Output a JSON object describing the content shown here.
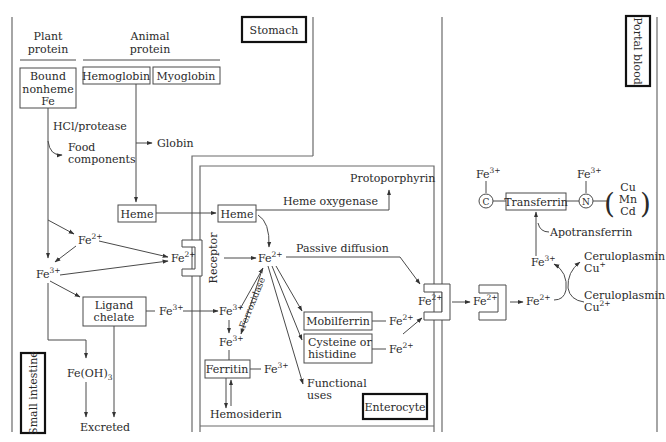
{
  "regions": {
    "stomach": "Stomach",
    "portal_blood": "Portal blood",
    "small_intestine": "Small intestine",
    "enterocyte": "Enterocyte"
  },
  "headers": {
    "plant_protein_l1": "Plant",
    "plant_protein_l2": "protein",
    "animal_protein_l1": "Animal",
    "animal_protein_l2": "protein"
  },
  "boxes": {
    "bound_nonheme_l1": "Bound",
    "bound_nonheme_l2": "nonheme",
    "bound_nonheme_l3": "Fe",
    "hemoglobin": "Hemoglobin",
    "myoglobin": "Myoglobin",
    "heme_lumen": "Heme",
    "heme_cell": "Heme",
    "ligand_l1": "Ligand",
    "ligand_l2": "chelate",
    "ferritin": "Ferritin",
    "mobilferrin": "Mobilferrin",
    "cysteine_l1": "Cysteine or",
    "cysteine_l2": "histidine",
    "transferrin": "Transferrin"
  },
  "labels": {
    "hcl_protease": "HCl/protease",
    "food_l1": "Food",
    "food_l2": "components",
    "globin": "Globin",
    "protoporphyrin": "Protoporphyrin",
    "heme_oxygenase": "Heme oxygenase",
    "passive_diffusion": "Passive diffusion",
    "receptor": "Receptor",
    "ferroxidase": "Ferroxidase",
    "functional_l1": "Functional",
    "functional_l2": "uses",
    "hemosiderin": "Hemosiderin",
    "fe_oh3": "Fe(OH)",
    "fe_oh3_sub": "3",
    "excreted": "Excreted",
    "apotransferrin": "Apotransferrin",
    "ceruloplasmin_a": "Ceruloplasmin",
    "cu_plus": "Cu",
    "cu_plus_sup": "+",
    "ceruloplasmin_b": "Ceruloplasmin",
    "cu_2plus": "Cu",
    "cu_2plus_sup": "2+",
    "c_site": "C",
    "n_site": "N",
    "metal_cu": "Cu",
    "metal_mn": "Mn",
    "metal_cd": "Cd"
  },
  "ions": {
    "fe": "Fe",
    "two_plus": "2+",
    "three_plus": "3+"
  }
}
